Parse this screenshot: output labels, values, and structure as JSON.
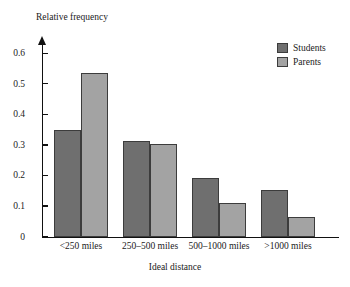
{
  "chart_data": {
    "type": "bar",
    "title": "",
    "xlabel": "Ideal distance",
    "ylabel": "Relative frequency",
    "categories": [
      "<250 miles",
      "250–500 miles",
      "500–1000 miles",
      ">1000 miles"
    ],
    "series": [
      {
        "name": "Students",
        "color": "#6f6f6f",
        "values": [
          0.35,
          0.312,
          0.193,
          0.153
        ]
      },
      {
        "name": "Parents",
        "color": "#a3a3a3",
        "values": [
          0.535,
          0.303,
          0.111,
          0.065
        ]
      }
    ],
    "ylim": [
      0,
      0.65
    ],
    "yticks": [
      0,
      0.1,
      0.2,
      0.3,
      0.4,
      0.5,
      0.6
    ],
    "ytick_labels": [
      "0",
      "0.1",
      "0.2",
      "0.3",
      "0.4",
      "0.5",
      "0.6"
    ],
    "grid": false,
    "legend_position": "top-right",
    "axis_color": "#111111",
    "bar_border_color": "#3c3c3c",
    "background": "#ffffff"
  },
  "legend": {
    "items": [
      {
        "label": "Students",
        "color": "#6f6f6f"
      },
      {
        "label": "Parents",
        "color": "#a3a3a3"
      }
    ]
  }
}
